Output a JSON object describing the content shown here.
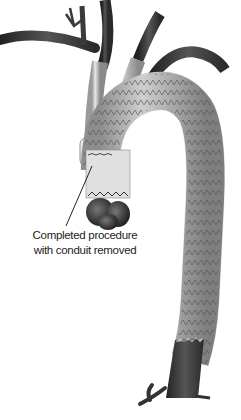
{
  "figure": {
    "annotation": {
      "line1": "Completed procedure",
      "line2": "with conduit removed"
    },
    "colors": {
      "vessel_dark": "#3a3a3a",
      "graft_light": "#d8d8d8",
      "stent_line": "#555555",
      "text": "#222222"
    }
  }
}
